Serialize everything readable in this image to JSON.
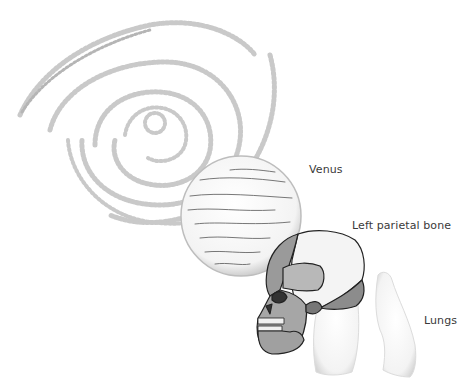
{
  "labels": {
    "venus": "Venus",
    "left_parietal_bone": "Left parietal bone",
    "lungs": "Lungs"
  },
  "illustrations": [
    "spiral-galaxy",
    "planet-venus",
    "human-skull",
    "lungs"
  ],
  "colors": {
    "background": "#ffffff",
    "label_text": "#3a3a3a",
    "bone_light": "#f4f4f4",
    "bone_dark": "#8a8a8a",
    "bone_mid": "#b8b8b8",
    "lung_fill": "#f2f2f2"
  }
}
